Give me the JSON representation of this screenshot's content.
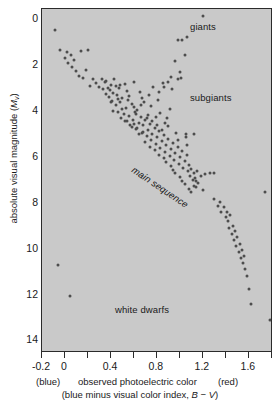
{
  "figure": {
    "background": "#ffffff",
    "plot_background": "#c9c9c9",
    "point_color": "#4d4d4d",
    "axis_color": "#2b2b2b"
  },
  "axes": {
    "y_title_prefix": "absolute visual magnitude (",
    "y_title_symbol": "M",
    "y_title_subscript": "v",
    "y_title_suffix": ")",
    "y_major_labels": [
      "0",
      "2",
      "4",
      "6",
      "8",
      "10",
      "12",
      "14"
    ],
    "y_major_values": [
      0,
      2,
      4,
      6,
      8,
      10,
      12,
      14
    ],
    "y_minor_values": [
      1,
      3,
      5,
      7,
      9,
      11,
      13
    ],
    "x_major_labels": [
      "-0.2",
      "0",
      "0.4",
      "0.8",
      "1.2",
      "1.6"
    ],
    "x_major_values": [
      -0.2,
      0,
      0.4,
      0.8,
      1.2,
      1.6
    ],
    "x_tick_values": [
      -0.2,
      0,
      0.2,
      0.4,
      0.6,
      0.8,
      1.0,
      1.2,
      1.4,
      1.6,
      1.8
    ],
    "x_caption_blue": "(blue)",
    "x_caption_main": "observed photoelectric color",
    "x_caption_red": "(red)",
    "x_caption_sub_prefix": "(blue minus visual color index, ",
    "x_caption_sub_symbol": "B − V",
    "x_caption_sub_suffix": ")"
  },
  "annotations": {
    "giants": "giants",
    "subgiants": "subgiants",
    "main_sequence": "main sequence",
    "white_dwarfs": "white dwarfs"
  },
  "chart_data": {
    "type": "scatter",
    "title": "",
    "xlabel": "observed photoelectric color (blue minus visual color index, B − V)",
    "ylabel": "absolute visual magnitude (Mv)",
    "xlim": [
      -0.2,
      1.81
    ],
    "ylim": [
      14.55,
      -0.45
    ],
    "y_inverted": true,
    "grid": false,
    "legend": false,
    "point_count": 196,
    "groups": {
      "giants": "Bright evolved stars near Mv 0 to 1 at B-V 1.0 to 1.2",
      "subgiants": "Stars above the main sequence between B-V 0.8 and 1.1",
      "main_sequence": "Dense diagonal band from upper-left to lower-right",
      "white_dwarfs": "Two faint hot stars near Mv 10.7 and 12.0 at blue colors"
    },
    "points": [
      [
        -0.09,
        0.45
      ],
      [
        -0.06,
        10.72
      ],
      [
        0.04,
        12.05
      ],
      [
        -0.04,
        1.35
      ],
      [
        0.0,
        1.7
      ],
      [
        0.02,
        1.42
      ],
      [
        0.03,
        1.9
      ],
      [
        0.05,
        1.55
      ],
      [
        0.06,
        2.08
      ],
      [
        0.08,
        1.78
      ],
      [
        0.1,
        2.25
      ],
      [
        0.12,
        2.45
      ],
      [
        0.14,
        1.38
      ],
      [
        0.16,
        2.55
      ],
      [
        0.2,
        1.35
      ],
      [
        0.18,
        2.2
      ],
      [
        0.3,
        2.95
      ],
      [
        0.32,
        2.6
      ],
      [
        0.33,
        3.05
      ],
      [
        0.35,
        2.75
      ],
      [
        0.36,
        3.25
      ],
      [
        0.37,
        2.98
      ],
      [
        0.38,
        3.4
      ],
      [
        0.39,
        3.08
      ],
      [
        0.4,
        2.85
      ],
      [
        0.41,
        3.55
      ],
      [
        0.42,
        3.2
      ],
      [
        0.43,
        2.62
      ],
      [
        0.44,
        3.72
      ],
      [
        0.45,
        3.3
      ],
      [
        0.46,
        4.05
      ],
      [
        0.47,
        3.0
      ],
      [
        0.48,
        3.62
      ],
      [
        0.49,
        4.3
      ],
      [
        0.5,
        3.45
      ],
      [
        0.51,
        4.12
      ],
      [
        0.52,
        2.82
      ],
      [
        0.53,
        3.88
      ],
      [
        0.54,
        4.45
      ],
      [
        0.55,
        3.52
      ],
      [
        0.56,
        4.22
      ],
      [
        0.57,
        4.62
      ],
      [
        0.58,
        3.7
      ],
      [
        0.59,
        4.38
      ],
      [
        0.6,
        2.72
      ],
      [
        0.61,
        4.05
      ],
      [
        0.62,
        4.78
      ],
      [
        0.63,
        3.95
      ],
      [
        0.64,
        4.5
      ],
      [
        0.65,
        3.18
      ],
      [
        0.66,
        4.25
      ],
      [
        0.67,
        4.95
      ],
      [
        0.68,
        4.6
      ],
      [
        0.69,
        3.6
      ],
      [
        0.7,
        4.4
      ],
      [
        0.71,
        5.1
      ],
      [
        0.72,
        4.82
      ],
      [
        0.73,
        3.3
      ],
      [
        0.74,
        4.55
      ],
      [
        0.75,
        5.28
      ],
      [
        0.76,
        4.98
      ],
      [
        0.77,
        2.95
      ],
      [
        0.78,
        4.72
      ],
      [
        0.79,
        5.45
      ],
      [
        0.8,
        5.12
      ],
      [
        0.81,
        3.52
      ],
      [
        0.82,
        4.88
      ],
      [
        0.83,
        5.62
      ],
      [
        0.84,
        5.3
      ],
      [
        0.85,
        2.78
      ],
      [
        0.86,
        5.05
      ],
      [
        0.87,
        5.8
      ],
      [
        0.88,
        5.48
      ],
      [
        0.89,
        4.3
      ],
      [
        0.9,
        5.22
      ],
      [
        0.91,
        5.95
      ],
      [
        0.92,
        5.65
      ],
      [
        0.93,
        3.05
      ],
      [
        0.94,
        5.4
      ],
      [
        0.95,
        6.12
      ],
      [
        0.96,
        5.82
      ],
      [
        0.97,
        4.95
      ],
      [
        0.98,
        5.58
      ],
      [
        0.99,
        6.3
      ],
      [
        1.0,
        6.0
      ],
      [
        1.01,
        2.55
      ],
      [
        1.02,
        5.75
      ],
      [
        1.03,
        6.48
      ],
      [
        1.04,
        6.18
      ],
      [
        1.05,
        5.15
      ],
      [
        1.06,
        5.92
      ],
      [
        1.07,
        6.62
      ],
      [
        1.08,
        6.35
      ],
      [
        1.09,
        6.82
      ],
      [
        1.1,
        6.52
      ],
      [
        1.11,
        7.0
      ],
      [
        1.12,
        6.7
      ],
      [
        1.13,
        6.9
      ],
      [
        1.14,
        7.3
      ],
      [
        1.15,
        6.6
      ],
      [
        1.16,
        7.12
      ],
      [
        1.18,
        6.85
      ],
      [
        1.2,
        7.45
      ],
      [
        1.22,
        6.75
      ],
      [
        1.26,
        6.7
      ],
      [
        1.3,
        6.72
      ],
      [
        0.44,
        2.92
      ],
      [
        0.46,
        3.48
      ],
      [
        0.5,
        3.9
      ],
      [
        0.54,
        3.12
      ],
      [
        0.58,
        4.68
      ],
      [
        0.6,
        3.82
      ],
      [
        0.62,
        4.15
      ],
      [
        0.64,
        5.02
      ],
      [
        0.66,
        3.72
      ],
      [
        0.68,
        4.92
      ],
      [
        0.7,
        5.35
      ],
      [
        0.72,
        4.18
      ],
      [
        0.74,
        5.55
      ],
      [
        0.76,
        4.45
      ],
      [
        0.78,
        5.68
      ],
      [
        0.8,
        4.62
      ],
      [
        0.82,
        5.9
      ],
      [
        0.84,
        4.82
      ],
      [
        0.86,
        6.05
      ],
      [
        0.88,
        6.22
      ],
      [
        0.9,
        4.65
      ],
      [
        0.92,
        6.4
      ],
      [
        0.94,
        6.55
      ],
      [
        0.96,
        6.72
      ],
      [
        0.98,
        5.28
      ],
      [
        1.0,
        6.88
      ],
      [
        1.02,
        7.05
      ],
      [
        1.04,
        7.2
      ],
      [
        1.06,
        5.5
      ],
      [
        1.08,
        7.38
      ],
      [
        0.36,
        2.68
      ],
      [
        0.4,
        3.62
      ],
      [
        0.42,
        4.0
      ],
      [
        0.48,
        2.88
      ],
      [
        0.52,
        4.42
      ],
      [
        0.56,
        3.35
      ],
      [
        0.6,
        4.55
      ],
      [
        0.63,
        4.72
      ],
      [
        0.67,
        3.42
      ],
      [
        0.71,
        4.32
      ],
      [
        0.75,
        3.78
      ],
      [
        0.79,
        4.25
      ],
      [
        0.83,
        4.08
      ],
      [
        0.87,
        4.52
      ],
      [
        0.91,
        3.92
      ],
      [
        1.1,
        7.55
      ],
      [
        1.12,
        7.28
      ],
      [
        1.14,
        7.05
      ],
      [
        1.3,
        7.85
      ],
      [
        1.33,
        8.15
      ],
      [
        1.35,
        7.95
      ],
      [
        1.36,
        8.42
      ],
      [
        1.38,
        8.2
      ],
      [
        1.4,
        8.6
      ],
      [
        1.41,
        8.38
      ],
      [
        1.42,
        8.8
      ],
      [
        1.43,
        9.1
      ],
      [
        1.44,
        8.55
      ],
      [
        1.45,
        9.35
      ],
      [
        1.46,
        9.0
      ],
      [
        1.47,
        9.62
      ],
      [
        1.48,
        9.25
      ],
      [
        1.49,
        9.9
      ],
      [
        1.5,
        9.5
      ],
      [
        1.51,
        10.15
      ],
      [
        1.52,
        9.78
      ],
      [
        1.53,
        10.4
      ],
      [
        1.54,
        10.05
      ],
      [
        1.55,
        10.62
      ],
      [
        1.56,
        10.32
      ],
      [
        1.57,
        10.9
      ],
      [
        1.58,
        11.2
      ],
      [
        1.6,
        11.78
      ],
      [
        1.62,
        12.4
      ],
      [
        1.74,
        7.55
      ],
      [
        1.78,
        13.1
      ],
      [
        1.2,
        -0.15
      ],
      [
        0.98,
        0.92
      ],
      [
        1.02,
        0.9
      ],
      [
        1.06,
        0.78
      ],
      [
        0.96,
        1.82
      ],
      [
        1.0,
        2.3
      ],
      [
        1.04,
        1.55
      ],
      [
        0.98,
        2.6
      ],
      [
        0.92,
        2.52
      ],
      [
        0.9,
        2.72
      ],
      [
        0.86,
        2.95
      ],
      [
        0.82,
        3.18
      ],
      [
        1.05,
        4.98
      ],
      [
        1.12,
        4.98
      ],
      [
        0.24,
        2.62
      ],
      [
        0.27,
        2.78
      ],
      [
        0.22,
        2.9
      ]
    ]
  }
}
